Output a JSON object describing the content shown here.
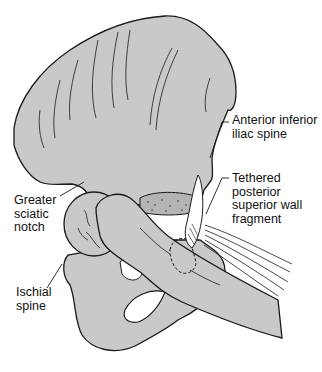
{
  "figure": {
    "colors": {
      "bone_fill": "#c9c9c9",
      "outline": "#1a1a1a",
      "background": "#ffffff"
    },
    "labels": [
      {
        "id": "anterior-inferior-iliac-spine",
        "text": "Anterior inferior\niliac spine"
      },
      {
        "id": "tethered-posterior-superior-wall-fragment",
        "text": "Tethered\nposterior\nsuperior wall\nfragment"
      },
      {
        "id": "greater-sciatic-notch",
        "text": "Greater\nsciatic\nnotch"
      },
      {
        "id": "ischial-spine",
        "text": "Ischial\nspine"
      }
    ]
  }
}
